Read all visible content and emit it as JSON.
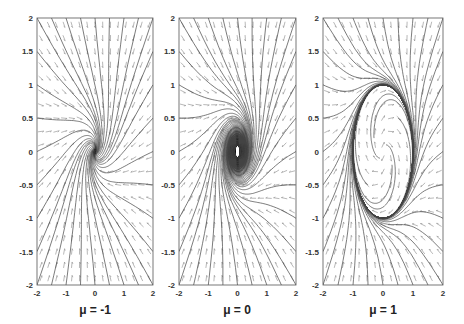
{
  "chart_data": {
    "type": "phase_portrait",
    "title": "",
    "xlabel": "",
    "ylabel": "",
    "xlim": [
      -2,
      2
    ],
    "ylim": [
      -2,
      2
    ],
    "grid": false,
    "legend": null,
    "panels": [
      {
        "mu": -1,
        "label": "μ = -1",
        "behavior": "stable focus at origin",
        "box": {
          "left": 37,
          "top": 18,
          "right": 153,
          "bottom": 285
        }
      },
      {
        "mu": 0,
        "label": "μ = 0",
        "behavior": "weakly attracting focus (dense spiral)",
        "box": {
          "left": 179,
          "top": 18,
          "right": 296,
          "bottom": 285
        }
      },
      {
        "mu": 1,
        "label": "μ = 1",
        "behavior": "stable limit cycle of radius 1",
        "box": {
          "left": 323,
          "top": 18,
          "right": 443,
          "bottom": 285
        }
      }
    ],
    "x_ticks": [
      "-2",
      "-1",
      "0",
      "1",
      "2"
    ],
    "x_tick_values": [
      -2,
      -1,
      0,
      1,
      2
    ],
    "y_ticks": [
      "2",
      "1.5",
      "1",
      "0.5",
      "0",
      "-0.5",
      "-1",
      "-1.5",
      "-2"
    ],
    "y_tick_values": [
      2,
      1.5,
      1,
      0.5,
      0,
      -0.5,
      -1,
      -1.5,
      -2
    ],
    "vector_field": {
      "nx": 15,
      "ny": 20,
      "arrow_len_px": 6
    },
    "colors": {
      "axes": "#555555",
      "trajectory": "#444444",
      "field": "#888888",
      "text": "#222222"
    }
  }
}
